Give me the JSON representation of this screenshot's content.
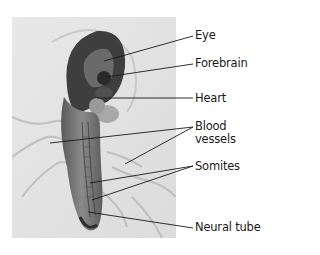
{
  "figure": {
    "labels": [
      {
        "id": "eye",
        "text": "Eye"
      },
      {
        "id": "forebrain",
        "text": "Forebrain"
      },
      {
        "id": "heart",
        "text": "Heart"
      },
      {
        "id": "blood-vessels",
        "line1": "Blood",
        "line2": "vessels"
      },
      {
        "id": "somites",
        "text": "Somites"
      },
      {
        "id": "neural-tube",
        "text": "Neural tube"
      }
    ],
    "colors": {
      "background": "#ffffff",
      "photo_bg": "#e4e4e4",
      "embryo_dark": "#3a3a3a",
      "embryo_mid": "#7a7a7a",
      "leader_line": "#1a1a1a"
    }
  }
}
